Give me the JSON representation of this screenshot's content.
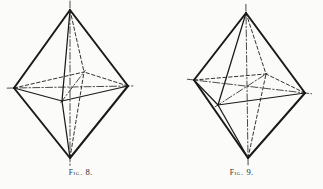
{
  "plate": {
    "background_color": "#fbfbfa",
    "ink_color": "#1a1a1a",
    "width": 323,
    "height": 189
  },
  "figures": [
    {
      "id": "fig-8",
      "caption_word": "Fig.",
      "caption_number": "8.",
      "caption_full": "FIG. 8.",
      "shape_name": "octahedron",
      "description": "Octahedron crystal form drawn in perspective with hidden edges dashed and crystallographic axes dash-dotted",
      "vertices": {
        "top": [
          70,
          10
        ],
        "bottom": [
          70,
          158
        ],
        "left": [
          14,
          88
        ],
        "right": [
          128,
          86
        ],
        "front": [
          62,
          101
        ],
        "back": [
          84,
          72
        ]
      },
      "solid_edges": [
        [
          "top",
          "left"
        ],
        [
          "top",
          "right"
        ],
        [
          "top",
          "front"
        ],
        [
          "bottom",
          "left"
        ],
        [
          "bottom",
          "right"
        ],
        [
          "bottom",
          "front"
        ],
        [
          "left",
          "front"
        ],
        [
          "right",
          "front"
        ]
      ],
      "dashed_edges": [
        [
          "top",
          "back"
        ],
        [
          "bottom",
          "back"
        ],
        [
          "left",
          "back"
        ],
        [
          "right",
          "back"
        ]
      ],
      "axes": [
        [
          "top",
          "bottom"
        ],
        [
          "left",
          "right"
        ],
        [
          "front",
          "back"
        ]
      ]
    },
    {
      "id": "fig-9",
      "caption_word": "Fig.",
      "caption_number": "9.",
      "caption_full": "FIG. 9.",
      "shape_name": "octahedron",
      "description": "Octahedron crystal form drawn in a second orientation with hidden edges dashed and crystallographic axes dash-dotted",
      "vertices": {
        "top": [
          85,
          13
        ],
        "bottom": [
          87,
          158
        ],
        "left": [
          33,
          80
        ],
        "right": [
          144,
          93
        ],
        "front": [
          57,
          105
        ],
        "back": [
          105,
          74
        ]
      },
      "solid_edges": [
        [
          "top",
          "left"
        ],
        [
          "top",
          "right"
        ],
        [
          "top",
          "front"
        ],
        [
          "bottom",
          "left"
        ],
        [
          "bottom",
          "right"
        ],
        [
          "bottom",
          "front"
        ],
        [
          "left",
          "front"
        ],
        [
          "right",
          "front"
        ]
      ],
      "dashed_edges": [
        [
          "top",
          "back"
        ],
        [
          "bottom",
          "back"
        ],
        [
          "left",
          "back"
        ],
        [
          "right",
          "back"
        ]
      ],
      "axes": [
        [
          "top",
          "bottom"
        ],
        [
          "left",
          "right"
        ],
        [
          "front",
          "back"
        ]
      ]
    }
  ]
}
